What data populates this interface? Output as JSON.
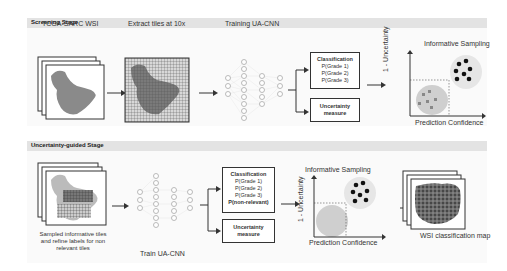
{
  "screening_stage": {
    "title": "Screening Stage",
    "steps": {
      "wsi": "TCGA-SARC WSI",
      "extract": "Extract tiles at 10x",
      "train": "Training UA-CNN",
      "sampling": "Informative Sampling"
    },
    "classification_box": {
      "title": "Classification",
      "items": [
        "P(Grade 1)",
        "P(Grade 2)",
        "P(Grade 3)"
      ]
    },
    "uncertainty_box": {
      "line1": "Uncertainty",
      "line2": "measure"
    },
    "plot": {
      "ylabel": "1 - Uncertainty",
      "xlabel": "Prediction Confidence"
    }
  },
  "guided_stage": {
    "title": "Uncertainty-guided Stage",
    "steps": {
      "sampled_line1": "Sampled informative tiles",
      "sampled_line2": "and refine labels for non",
      "sampled_line3": "relevant tiles",
      "train": "Train UA-CNN",
      "sampling": "Informative Sampling",
      "map": "WSI classification map"
    },
    "classification_box": {
      "title": "Classification",
      "items": [
        "P(Grade 1)",
        "P(Grade 2)",
        "P(Grade 3)"
      ],
      "extra": "P(non-relevant)"
    },
    "uncertainty_box": {
      "line1": "Uncertainty",
      "line2": "measure"
    },
    "plot": {
      "ylabel": "1 - Uncertainty",
      "xlabel": "Prediction Confidence"
    }
  },
  "colors": {
    "header_bg": "#e3e3e3",
    "tissue": "#8a8a8a",
    "tile_grid": "#555555",
    "dark_dot": "#111111",
    "cluster_bg": "#cfcfcf"
  }
}
